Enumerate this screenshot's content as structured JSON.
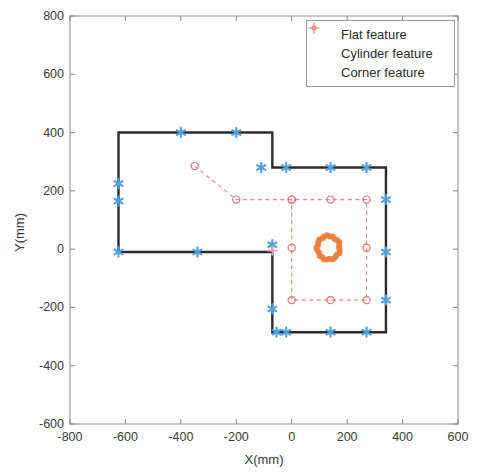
{
  "chart_data": {
    "type": "scatter",
    "title": "",
    "xlabel": "X(mm)",
    "ylabel": "Y(mm)",
    "xlim": [
      -800,
      600
    ],
    "ylim": [
      -600,
      800
    ],
    "xticks": [
      -800,
      -600,
      -400,
      -200,
      0,
      200,
      400,
      600
    ],
    "yticks": [
      -600,
      -400,
      -200,
      0,
      200,
      400,
      600,
      800
    ],
    "xtick_labels": [
      "-800",
      "-600",
      "-400",
      "-200",
      "0",
      "200",
      "400",
      "600"
    ],
    "ytick_labels": [
      "-600",
      "-400",
      "-200",
      "0",
      "200",
      "400",
      "600",
      "800"
    ],
    "grid": false,
    "legend_position": "top-right",
    "legend": [
      {
        "label": "Flat feature",
        "color": "#4f9fe0",
        "marker": "asterisk"
      },
      {
        "label": "Cylinder feature",
        "color": "#ef7c3c",
        "marker": "point"
      },
      {
        "label": "Corner feature",
        "color": "#f49ab5",
        "marker": "plus"
      }
    ],
    "series": [
      {
        "name": "Room outline",
        "type": "polygon",
        "color": "#2b2b2b",
        "linewidth": 2.4,
        "points": [
          [
            -625,
            400
          ],
          [
            -70,
            400
          ],
          [
            -70,
            280
          ],
          [
            340,
            280
          ],
          [
            340,
            -285
          ],
          [
            -70,
            -285
          ],
          [
            -70,
            -10
          ],
          [
            -625,
            -10
          ]
        ]
      },
      {
        "name": "Flat feature",
        "type": "scatter",
        "color": "#4f9fe0",
        "marker": "asterisk",
        "points": [
          [
            -400,
            400
          ],
          [
            -200,
            400
          ],
          [
            -625,
            225
          ],
          [
            -625,
            165
          ],
          [
            -625,
            -10
          ],
          [
            -340,
            -10
          ],
          [
            -110,
            280
          ],
          [
            -20,
            280
          ],
          [
            140,
            280
          ],
          [
            270,
            280
          ],
          [
            340,
            170
          ],
          [
            340,
            -10
          ],
          [
            340,
            -175
          ],
          [
            270,
            -285
          ],
          [
            140,
            -285
          ],
          [
            -20,
            -285
          ],
          [
            -55,
            -285
          ],
          [
            -70,
            -205
          ],
          [
            -70,
            15
          ]
        ]
      },
      {
        "name": "Cylinder feature",
        "type": "scatter-ring",
        "color": "#ef7c3c",
        "center": [
          133,
          5
        ],
        "radius": 42,
        "n_points": 26
      },
      {
        "name": "Corner feature",
        "type": "scatter",
        "color": "#f49ab5",
        "marker": "plus",
        "points": [
          [
            -70,
            -5
          ]
        ]
      },
      {
        "name": "Trajectory",
        "type": "line-dashed",
        "color": "#e8707a",
        "marker": "circle-open",
        "points": [
          [
            -350,
            285
          ],
          [
            -200,
            170
          ],
          [
            0,
            170
          ],
          [
            140,
            170
          ],
          [
            270,
            170
          ],
          [
            270,
            5
          ],
          [
            270,
            -175
          ],
          [
            140,
            -175
          ],
          [
            0,
            -175
          ],
          [
            0,
            5
          ],
          [
            0,
            170
          ]
        ]
      }
    ]
  },
  "legend_box": {
    "items": [
      "Flat feature",
      "Cylinder feature",
      "Corner feature"
    ]
  },
  "axes": {
    "x_title": "X(mm)",
    "y_title": "Y(mm)"
  }
}
